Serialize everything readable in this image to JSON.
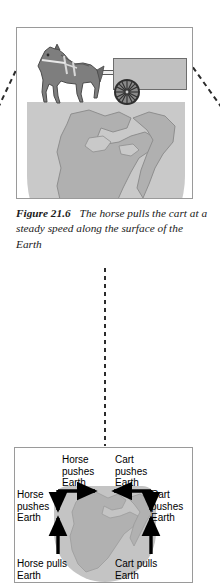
{
  "figure": {
    "number": "Figure 21.6",
    "caption_line1": "The horse pulls the cart",
    "caption_line2": "at a steady speed along the surface of",
    "caption_line3": "the Earth",
    "caption_full": "Figure 21.6  The horse pulls the cart at a steady speed along the surface of the Earth"
  },
  "top_panel": {
    "scene_description": "Horse harnessed to a two-wheeled cart standing on the curved surface of the Earth",
    "elements": {
      "horse": "horse",
      "cart": "cart",
      "shaft": "cart-shaft",
      "wheel": "cart-wheel",
      "globe": "earth-globe"
    }
  },
  "bottom_panel": {
    "globe": "earth-globe",
    "labels": {
      "top_left": "Horse\npushes\nEarth",
      "top_right": "Cart\npushes\nEarth",
      "mid_left": "Horse\npushes\nEarth",
      "mid_right": "Cart\npushes\nEarth",
      "bottom_left": "Horse pulls\nEarth",
      "bottom_right": "Cart pulls\nEarth"
    },
    "arrows": [
      {
        "name": "horse-push-horizontal",
        "direction": "right"
      },
      {
        "name": "cart-push-horizontal",
        "direction": "left"
      },
      {
        "name": "horse-push-vertical",
        "direction": "down"
      },
      {
        "name": "cart-push-vertical",
        "direction": "down"
      },
      {
        "name": "horse-pull-vertical",
        "direction": "up"
      },
      {
        "name": "cart-pull-vertical",
        "direction": "up"
      }
    ]
  },
  "connectors": {
    "left_diagonal": "dashed-leader-left",
    "right_diagonal": "dashed-leader-right",
    "vertical": "dashed-leader-vertical"
  },
  "colors": {
    "globe_ocean": "#c9c9c9",
    "globe_land": "#b0b0b0",
    "horse_body": "#7e7e7e",
    "cart_body": "#c0c0c0",
    "panel_border": "#9a9a9a",
    "arrow": "#000000",
    "text": "#1a1a1a"
  }
}
